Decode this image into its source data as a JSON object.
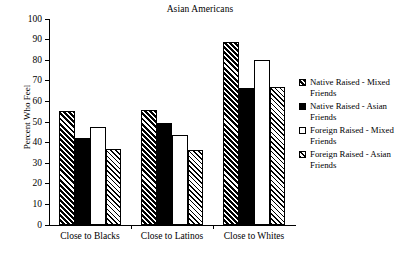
{
  "chart_data": {
    "type": "bar",
    "title": "Asian Americans",
    "xlabel": "",
    "ylabel": "Percent Who Feel",
    "ylim": [
      0,
      100
    ],
    "ytick_labels": [
      "100",
      "90",
      "80",
      "70",
      "60",
      "50",
      "40",
      "30",
      "20",
      "10",
      "0"
    ],
    "ytick_values": [
      100,
      90,
      80,
      70,
      60,
      50,
      40,
      30,
      20,
      10,
      0
    ],
    "grid": false,
    "legend_position": "right",
    "categories": [
      "Close to Blacks",
      "Close to Latinos",
      "Close to Whites"
    ],
    "series": [
      {
        "name": "Native Raised - Mixed Friends",
        "pattern": "hatch-dense",
        "values": [
          55.5,
          56,
          89
        ]
      },
      {
        "name": "Native Raised - Asian Friends",
        "pattern": "solid-black",
        "values": [
          42,
          49.5,
          66.5
        ]
      },
      {
        "name": "Foreign Raised - Mixed Friends",
        "pattern": "white",
        "values": [
          47.5,
          43.5,
          80
        ]
      },
      {
        "name": "Foreign Raised - Asian Friends",
        "pattern": "hatch-light",
        "values": [
          37,
          36.5,
          67
        ]
      }
    ]
  },
  "legend": {
    "entries": [
      {
        "line1": "Native Raised - Mixed",
        "line2": "Friends",
        "pattern": "hatch-dense"
      },
      {
        "line1": "Native Raised - Asian",
        "line2": "Friends",
        "pattern": "solid-black"
      },
      {
        "line1": "Foreign Raised - Mixed",
        "line2": "Friends",
        "pattern": "white"
      },
      {
        "line1": "Foreign Raised - Asian",
        "line2": "Friends",
        "pattern": "hatch-light"
      }
    ]
  },
  "colors": {
    "ink": "#000000",
    "background": "#ffffff"
  }
}
